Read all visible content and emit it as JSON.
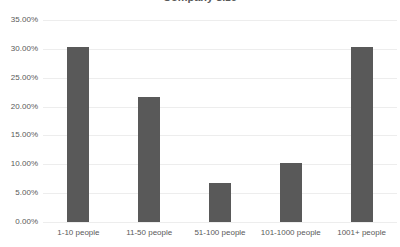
{
  "chart_data": {
    "type": "bar",
    "title": "",
    "xlabel": "",
    "ylabel": "",
    "categories": [
      "1-10 people",
      "11-50 people",
      "51-100 people",
      "101-1000 people",
      "1001+ people"
    ],
    "values": [
      30.4,
      21.6,
      6.8,
      10.3,
      30.4
    ],
    "value_labels": [
      "30.40%",
      "21.60%",
      "6.80%",
      "10.30%",
      "30.40%"
    ],
    "ylim": [
      0,
      35
    ],
    "ytick_values": [
      0,
      5,
      10,
      15,
      20,
      25,
      30,
      35
    ],
    "ytick_labels": [
      "0.00%",
      "5.00%",
      "10.00%",
      "15.00%",
      "20.00%",
      "25.00%",
      "30.00%",
      "35.00%"
    ],
    "grid": true,
    "legend": false,
    "legend_position": "none",
    "series": [
      {
        "name": "",
        "values": [
          30.4,
          21.6,
          6.8,
          10.3,
          30.4
        ]
      }
    ]
  },
  "style": {
    "bar_color": "#595959",
    "grid_color": "#ededed",
    "text_color": "#595959",
    "background": "#ffffff"
  },
  "header": {
    "title_fragment": "Company size"
  }
}
